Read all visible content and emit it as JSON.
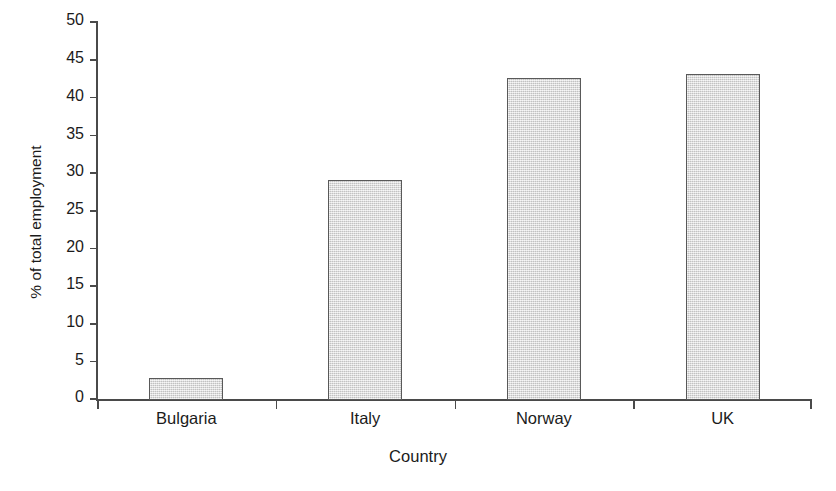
{
  "figure": {
    "title_remnant": "",
    "background_color": "#ffffff"
  },
  "style": {
    "bar_fill": "#d9d9d9",
    "bar_border": "#595959",
    "axis_color": "#4a4a4a",
    "text_color": "#1b1b1b"
  },
  "chart_data": {
    "type": "bar",
    "title": "",
    "xlabel": "Country",
    "ylabel": "% of total employment",
    "categories": [
      "Bulgaria",
      "Italy",
      "Norway",
      "UK"
    ],
    "values": [
      2.9,
      29.2,
      42.7,
      43.2
    ],
    "ylim": [
      0,
      50
    ],
    "ytick_step": 5,
    "yticks": [
      0,
      5,
      10,
      15,
      20,
      25,
      30,
      35,
      40,
      45,
      50
    ],
    "ytick_labels": [
      "0",
      "5",
      "10",
      "15",
      "20",
      "25",
      "30",
      "35",
      "40",
      "45",
      "50"
    ],
    "grid": false,
    "legend": null,
    "series": [
      {
        "name": "% of total employment",
        "values": [
          2.9,
          29.2,
          42.7,
          43.2
        ]
      }
    ]
  }
}
